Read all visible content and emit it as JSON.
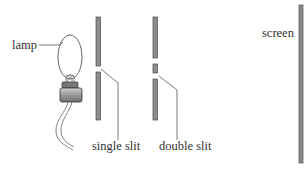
{
  "diagram": {
    "type": "double-slit-experiment-setup",
    "labels": {
      "lamp": "lamp",
      "single_slit": "single slit",
      "double_slit": "double slit",
      "screen": "screen"
    },
    "colors": {
      "barrier_fill": "#8c8c8c",
      "barrier_stroke": "#4a4a4a",
      "line": "#555555",
      "text": "#333333"
    }
  }
}
